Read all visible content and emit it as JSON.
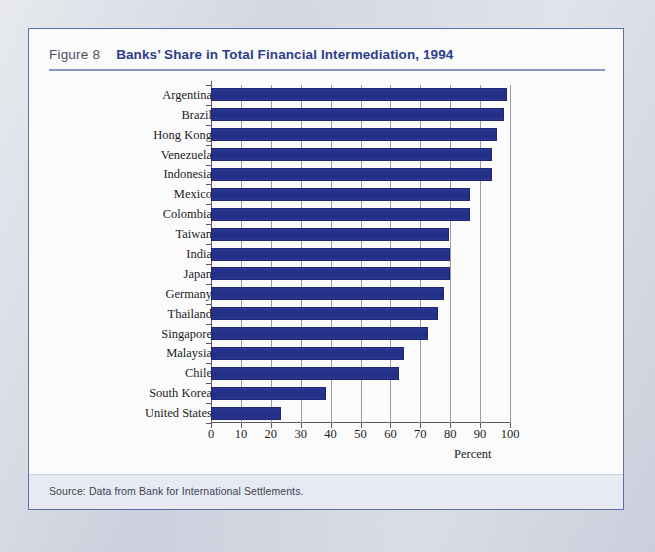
{
  "figure": {
    "number_label": "Figure 8",
    "title": "Banks’ Share in Total Financial Intermediation, 1994",
    "source_note": "Source: Data from Bank for International Settlements."
  },
  "colors": {
    "bar": "#27338c",
    "title_blue": "#2b3f8c",
    "card_border": "#5b6fae",
    "rule": "#8a95c4",
    "axis": "#5a5a62",
    "gridline": "#9a9aa4",
    "page_background": "#cfd3dd",
    "card_background": "#fbfbfc",
    "source_band": "#e7eaf3"
  },
  "chart_data": {
    "type": "bar",
    "orientation": "horizontal",
    "title": "Banks’ Share in Total Financial Intermediation, 1994",
    "xlabel": "Percent",
    "ylabel": "",
    "xlim": [
      0,
      100
    ],
    "xticks": [
      0,
      10,
      20,
      30,
      40,
      50,
      60,
      70,
      80,
      90,
      100
    ],
    "xtick_labels": [
      "0",
      "10",
      "20",
      "30",
      "40",
      "50",
      "60",
      "70",
      "80",
      "90",
      "100"
    ],
    "grid": true,
    "grid_axis": "x",
    "legend": false,
    "categories": [
      "Argentina",
      "Brazil",
      "Hong Kong",
      "Venezuela",
      "Indonesia",
      "Mexico",
      "Colombia",
      "Taiwan",
      "India",
      "Japan",
      "Germany",
      "Thailand",
      "Singapore",
      "Malaysia",
      "Chile",
      "South Korea",
      "United States"
    ],
    "values": [
      99,
      98,
      95.5,
      94,
      94,
      86.5,
      86.5,
      79.5,
      80,
      80,
      78,
      76,
      72.5,
      64.5,
      63,
      38.5,
      23.5
    ],
    "units": "percent"
  }
}
